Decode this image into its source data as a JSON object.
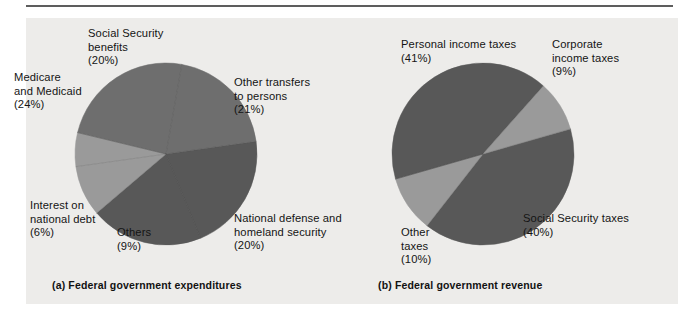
{
  "figure": {
    "background_color": "#edecea",
    "page_color": "#ffffff",
    "rule_color": "#5d5d5d",
    "palette": {
      "dark_gray": "#585858",
      "medium_gray": "#6e6e6e",
      "light_gray": "#9a9a9a"
    }
  },
  "captions": {
    "a": "(a) Federal government expenditures",
    "b": "(b) Federal government revenue"
  },
  "labels": {
    "expenditures": {
      "social_security_benefits": "Social Security\nbenefits\n(20%)",
      "medicare_medicaid": "Medicare\nand Medicaid\n(24%)",
      "interest_national_debt": "Interest on\nnational debt\n(6%)",
      "others": "Others\n(9%)",
      "national_defense": "National defense and\nhomeland security\n(20%)",
      "other_transfers": "Other transfers\nto persons\n(21%)"
    },
    "revenue": {
      "personal_income_taxes": "Personal income taxes\n(41%)",
      "corporate_income_taxes": "Corporate\nincome taxes\n(9%)",
      "social_security_taxes": "Social Security taxes\n(40%)",
      "other_taxes": "Other\ntaxes\n(10%)"
    }
  },
  "chart_data": [
    {
      "type": "pie",
      "id": "federal-government-expenditures",
      "title": "(a) Federal government expenditures",
      "legend_position": "outside-labels",
      "center": [
        166,
        154
      ],
      "radius": 91,
      "start_angle_deg": -8,
      "categories": [
        "Other transfers to persons",
        "National defense and homeland security",
        "Others",
        "Interest on national debt",
        "Medicare and Medicaid",
        "Social Security benefits"
      ],
      "values": [
        21,
        20,
        9,
        6,
        24,
        20
      ],
      "units": "percent",
      "colors": [
        "#585858",
        "#585858",
        "#9a9a9a",
        "#9a9a9a",
        "#6e6e6e",
        "#6e6e6e"
      ],
      "labels": [
        "Other transfers to persons (21%)",
        "National defense and homeland security (20%)",
        "Others (9%)",
        "Interest on national debt (6%)",
        "Medicare and Medicaid (24%)",
        "Social Security benefits (20%)"
      ]
    },
    {
      "type": "pie",
      "id": "federal-government-revenue",
      "title": "(b) Federal government revenue",
      "legend_position": "outside-labels",
      "center": [
        483,
        154
      ],
      "radius": 91,
      "start_angle_deg": -16,
      "categories": [
        "Social Security taxes",
        "Other taxes",
        "Personal income taxes",
        "Corporate income taxes"
      ],
      "values": [
        40,
        10,
        41,
        9
      ],
      "units": "percent",
      "colors": [
        "#585858",
        "#9a9a9a",
        "#585858",
        "#9a9a9a"
      ],
      "labels": [
        "Social Security taxes (40%)",
        "Other taxes (10%)",
        "Personal income taxes (41%)",
        "Corporate income taxes (9%)"
      ]
    }
  ]
}
